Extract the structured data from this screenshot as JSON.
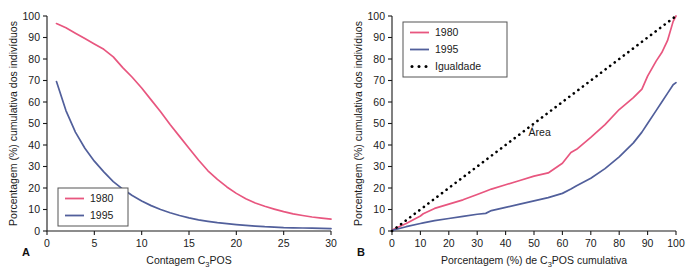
{
  "figure": {
    "panels": [
      {
        "letter": "A",
        "xlabel_pre": "Contagem C",
        "xlabel_sub": "3",
        "xlabel_post": "POS",
        "ylabel": "Porcentagem (%) cumulativa dos indivíduos"
      },
      {
        "letter": "B",
        "xlabel_pre": "Porcentagem (%) de C",
        "xlabel_sub": "3",
        "xlabel_post": "POS cumulativa",
        "ylabel": "Porcentagem (%) cumulativa dos indivíduos",
        "annotation": "Área"
      }
    ]
  },
  "colors": {
    "series_1980": "#e8567f",
    "series_1995": "#515f9b",
    "equality": "#000000",
    "axis": "#1a1a1a",
    "background": "#ffffff"
  },
  "chart_data": [
    {
      "type": "line",
      "title": "",
      "panel": "A",
      "xlabel": "Contagem C3POS",
      "ylabel": "Porcentagem (%) cumulativa dos indivíduos",
      "xlim": [
        0,
        30
      ],
      "ylim": [
        0,
        100
      ],
      "xticks": [
        0,
        5,
        10,
        15,
        20,
        25,
        30
      ],
      "yticks": [
        0,
        10,
        20,
        30,
        40,
        50,
        60,
        70,
        80,
        90,
        100
      ],
      "grid": false,
      "legend_position": "bottom-left",
      "legend": [
        "1980",
        "1995"
      ],
      "x": [
        1,
        2,
        3,
        4,
        5,
        6,
        7,
        8,
        9,
        10,
        11,
        12,
        13,
        14,
        15,
        16,
        17,
        18,
        19,
        20,
        21,
        22,
        23,
        24,
        25,
        26,
        27,
        28,
        29,
        30
      ],
      "series": [
        {
          "name": "1980",
          "color": "#e8567f",
          "values": [
            96.5,
            94.5,
            92.0,
            89.5,
            87.0,
            84.5,
            81.0,
            76.0,
            71.5,
            66.5,
            61.0,
            55.5,
            49.5,
            44.0,
            38.5,
            33.0,
            28.0,
            24.0,
            20.5,
            17.5,
            15.0,
            13.0,
            11.5,
            10.2,
            9.0,
            8.0,
            7.2,
            6.5,
            6.0,
            5.5
          ]
        },
        {
          "name": "1995",
          "color": "#515f9b",
          "values": [
            69.5,
            56.0,
            46.0,
            38.5,
            32.5,
            27.5,
            23.0,
            19.5,
            16.5,
            14.0,
            11.8,
            10.0,
            8.5,
            7.2,
            6.1,
            5.2,
            4.5,
            3.9,
            3.4,
            3.0,
            2.6,
            2.3,
            2.0,
            1.8,
            1.6,
            1.5,
            1.4,
            1.3,
            1.2,
            1.1
          ]
        }
      ]
    },
    {
      "type": "line",
      "title": "",
      "panel": "B",
      "xlabel": "Porcentagem (%) de C3POS cumulativa",
      "ylabel": "Porcentagem (%) cumulativa dos indivíduos",
      "xlim": [
        0,
        100
      ],
      "ylim": [
        0,
        100
      ],
      "xticks": [
        0,
        10,
        20,
        30,
        40,
        50,
        60,
        70,
        80,
        90,
        100
      ],
      "yticks": [
        0,
        10,
        20,
        30,
        40,
        50,
        60,
        70,
        80,
        90,
        100
      ],
      "grid": false,
      "legend_position": "top-left",
      "legend": [
        "1980",
        "1995",
        "Igualdade"
      ],
      "annotations": [
        "Área"
      ],
      "x": [
        0,
        5,
        10,
        11,
        15,
        20,
        25,
        30,
        33,
        35,
        40,
        45,
        50,
        55,
        60,
        63,
        65,
        70,
        75,
        80,
        85,
        88,
        90,
        93,
        95,
        97,
        99,
        100
      ],
      "series": [
        {
          "name": "1980",
          "color": "#e8567f",
          "values": [
            0.5,
            3.5,
            7.0,
            8.0,
            10.5,
            12.5,
            14.5,
            17.0,
            18.5,
            19.5,
            21.5,
            23.5,
            25.5,
            27.0,
            31.5,
            36.5,
            38.0,
            43.5,
            49.5,
            56.5,
            62.0,
            66.0,
            72.0,
            79.0,
            83.0,
            88.5,
            97.5,
            100.0
          ]
        },
        {
          "name": "1995",
          "color": "#515f9b",
          "values": [
            0.3,
            2.0,
            3.5,
            3.8,
            4.8,
            5.8,
            6.8,
            7.8,
            8.2,
            9.5,
            11.0,
            12.5,
            14.0,
            15.5,
            17.5,
            19.5,
            21.0,
            24.5,
            29.0,
            34.5,
            41.0,
            46.0,
            50.0,
            56.0,
            60.0,
            64.0,
            68.0,
            69.0
          ]
        },
        {
          "name": "Igualdade",
          "color": "#000000",
          "style": "dotted",
          "values": [
            0,
            5,
            10,
            11,
            15,
            20,
            25,
            30,
            33,
            35,
            40,
            45,
            50,
            55,
            60,
            63,
            65,
            70,
            75,
            80,
            85,
            88,
            90,
            93,
            95,
            97,
            99,
            100
          ]
        }
      ]
    }
  ]
}
